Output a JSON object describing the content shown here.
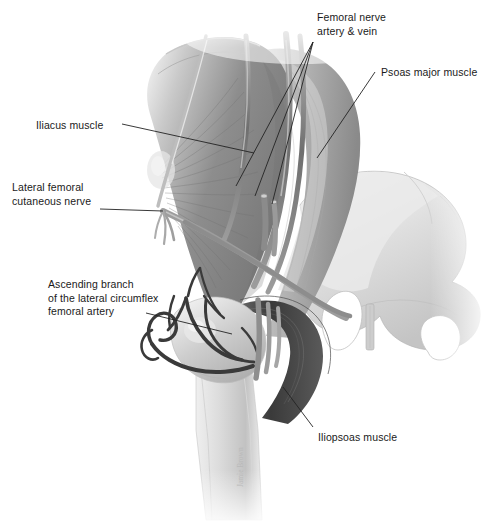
{
  "figure": {
    "style": "grayscale medical illustration",
    "background_color": "#ffffff",
    "ink_color": "#1a1a1a",
    "signature": "Jamie Brown"
  },
  "labels": [
    {
      "id": "femoral-bundle",
      "text": "Femoral nerve\nartery & vein",
      "x": 317,
      "y": 11,
      "align": "left"
    },
    {
      "id": "psoas-major",
      "text": "Psoas major muscle",
      "x": 381,
      "y": 66,
      "align": "left"
    },
    {
      "id": "iliacus",
      "text": "Iliacus muscle",
      "x": 36,
      "y": 119,
      "align": "left"
    },
    {
      "id": "lfcn",
      "text": "Lateral femoral\ncutaneous nerve",
      "x": 12,
      "y": 181,
      "align": "left"
    },
    {
      "id": "ascending-branch",
      "text": "Ascending branch\nof the lateral circumflex\nfemoral artery",
      "x": 48,
      "y": 278,
      "align": "left"
    },
    {
      "id": "iliopsoas",
      "text": "Iliopsoas muscle",
      "x": 318,
      "y": 431,
      "align": "left"
    }
  ],
  "leaders": [
    {
      "id": "leader-femoral-nerve",
      "points": "313,42 236,186"
    },
    {
      "id": "leader-femoral-artery",
      "points": "313,42 255,196"
    },
    {
      "id": "leader-femoral-vein",
      "points": "313,42 272,204"
    },
    {
      "id": "leader-psoas-major",
      "points": "375,72 317,158"
    },
    {
      "id": "leader-iliacus",
      "points": "122,124 254,153"
    },
    {
      "id": "leader-lfcn",
      "points": "100,209 163,211"
    },
    {
      "id": "leader-ascending-branch",
      "points": "146,313 232,334"
    },
    {
      "id": "leader-iliopsoas",
      "points": "313,427 283,387"
    }
  ],
  "structures": [
    {
      "id": "iliacus-muscle",
      "kind": "muscle",
      "tone": "#8f8f8f"
    },
    {
      "id": "psoas-major-muscle",
      "kind": "muscle",
      "tone": "#b9b9b9"
    },
    {
      "id": "iliopsoas-tendon",
      "kind": "tendon",
      "tone": "#4a4a4a"
    },
    {
      "id": "pelvis-bone",
      "kind": "bone",
      "tone": "#dcdcdc"
    },
    {
      "id": "femur-bone",
      "kind": "bone",
      "tone": "#d2d2d2"
    },
    {
      "id": "greater-trochanter",
      "kind": "bone",
      "tone": "#c8c8c8"
    },
    {
      "id": "femoral-nerve",
      "kind": "nerve",
      "tone": "#9a9a9a"
    },
    {
      "id": "femoral-artery",
      "kind": "artery",
      "tone": "#7d7d7d"
    },
    {
      "id": "femoral-vein",
      "kind": "vein",
      "tone": "#8a8a8a"
    },
    {
      "id": "lateral-femoral-cutaneous-nerve",
      "kind": "nerve",
      "tone": "#a5a5a5"
    },
    {
      "id": "ascending-branch-lateral-circumflex-femoral-artery",
      "kind": "artery",
      "tone": "#3b3b3b"
    },
    {
      "id": "obturator-foramen-left",
      "kind": "foramen",
      "tone": "#ffffff"
    },
    {
      "id": "obturator-foramen-right",
      "kind": "foramen",
      "tone": "#ffffff"
    },
    {
      "id": "pubic-symphysis",
      "kind": "joint",
      "tone": "#c0c0c0"
    }
  ]
}
